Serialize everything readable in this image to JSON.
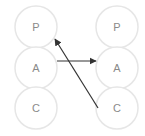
{
  "diagram": {
    "columns": [
      {
        "id": "left",
        "nodes": [
          {
            "id": "left-P",
            "label": "P"
          },
          {
            "id": "left-A",
            "label": "A"
          },
          {
            "id": "left-C",
            "label": "C"
          }
        ]
      },
      {
        "id": "right",
        "nodes": [
          {
            "id": "right-P",
            "label": "P"
          },
          {
            "id": "right-A",
            "label": "A"
          },
          {
            "id": "right-C",
            "label": "C"
          }
        ]
      }
    ],
    "edges": [
      {
        "from": "left-A",
        "to": "right-A",
        "arrow": "end"
      },
      {
        "from": "right-C",
        "to": "left-P",
        "arrow": "end"
      }
    ],
    "colors": {
      "circle_stroke": "#e6e6e6",
      "label": "#8a8a8a",
      "edge": "#333333"
    }
  }
}
